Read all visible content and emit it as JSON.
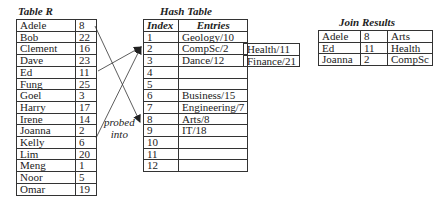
{
  "table_r": {
    "title": "Table R",
    "rows": [
      {
        "name": "Adele",
        "value": "8"
      },
      {
        "name": "Bob",
        "value": "22"
      },
      {
        "name": "Clement",
        "value": "16"
      },
      {
        "name": "Dave",
        "value": "23"
      },
      {
        "name": "Ed",
        "value": "11"
      },
      {
        "name": "Fung",
        "value": "25"
      },
      {
        "name": "Goel",
        "value": "3"
      },
      {
        "name": "Harry",
        "value": "17"
      },
      {
        "name": "Irene",
        "value": "14"
      },
      {
        "name": "Joanna",
        "value": "2"
      },
      {
        "name": "Kelly",
        "value": "6"
      },
      {
        "name": "Lim",
        "value": "20"
      },
      {
        "name": "Meng",
        "value": "1"
      },
      {
        "name": "Noor",
        "value": "5"
      },
      {
        "name": "Omar",
        "value": "19"
      }
    ]
  },
  "hash_table": {
    "title": "Hash Table",
    "headers": {
      "index": "Index",
      "entries": "Entries"
    },
    "rows": [
      {
        "index": "1",
        "entry": "Geology/10"
      },
      {
        "index": "2",
        "entry": "CompSc/2"
      },
      {
        "index": "3",
        "entry": "Dance/12"
      },
      {
        "index": "4",
        "entry": ""
      },
      {
        "index": "5",
        "entry": ""
      },
      {
        "index": "6",
        "entry": "Business/15"
      },
      {
        "index": "7",
        "entry": "Engineering/7"
      },
      {
        "index": "8",
        "entry": "Arts/8"
      },
      {
        "index": "9",
        "entry": "IT/18"
      },
      {
        "index": "10",
        "entry": ""
      },
      {
        "index": "11",
        "entry": ""
      },
      {
        "index": "12",
        "entry": ""
      }
    ],
    "overflow": [
      {
        "row_index": "2",
        "entry": "Health/11"
      },
      {
        "row_index": "3",
        "entry": "Finance/21"
      }
    ]
  },
  "join_results": {
    "title": "Join Results",
    "rows": [
      {
        "name": "Adele",
        "value": "8",
        "entry": "Arts"
      },
      {
        "name": "Ed",
        "value": "11",
        "entry": "Health"
      },
      {
        "name": "Joanna",
        "value": "2",
        "entry": "CompSc"
      }
    ]
  },
  "annotation": {
    "line1": "probed",
    "line2": "into"
  },
  "probes": [
    {
      "from_row": 0,
      "to_hash_row": 8
    },
    {
      "from_row": 4,
      "to_hash_row": 2
    },
    {
      "from_row": 9,
      "to_hash_row": 2
    }
  ]
}
